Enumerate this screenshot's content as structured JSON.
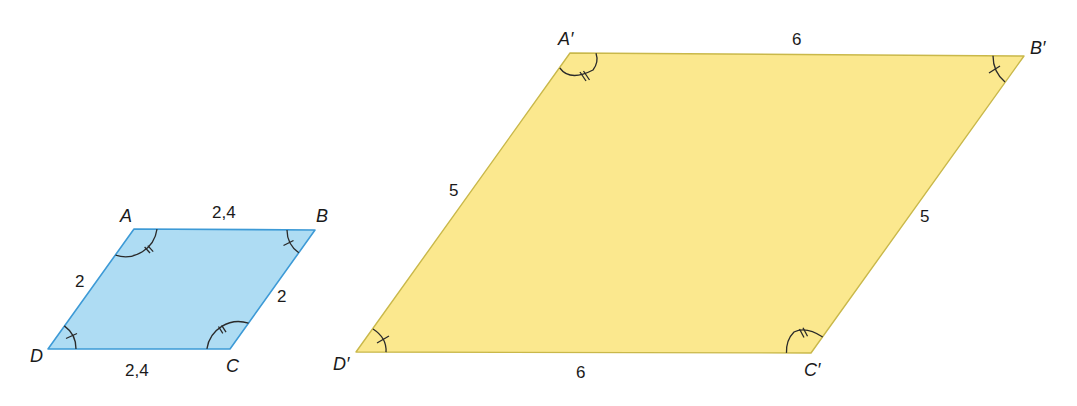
{
  "colors": {
    "small_fill": "#aedcf3",
    "small_stroke": "#3d9ad6",
    "large_fill": "#fbe88e",
    "large_stroke": "#c9b84a"
  },
  "small_parallelogram": {
    "name": "ABCD",
    "vertices": {
      "A": {
        "label": "A",
        "x": 134,
        "y": 229
      },
      "B": {
        "label": "B",
        "x": 315,
        "y": 230
      },
      "C": {
        "label": "C",
        "x": 230,
        "y": 349
      },
      "D": {
        "label": "D",
        "x": 48,
        "y": 349
      }
    },
    "sides": {
      "AB": "2,4",
      "BC": "2",
      "CD": "2,4",
      "DA": "2"
    },
    "angle_marks": {
      "A": "double-tick",
      "B": "single-tick",
      "C": "double-tick",
      "D": "single-tick"
    }
  },
  "large_parallelogram": {
    "name": "A'B'C'D'",
    "vertices": {
      "A": {
        "label": "A′",
        "x": 570,
        "y": 53
      },
      "B": {
        "label": "B′",
        "x": 1024,
        "y": 56
      },
      "C": {
        "label": "C′",
        "x": 811,
        "y": 353
      },
      "D": {
        "label": "D′",
        "x": 356,
        "y": 352
      }
    },
    "sides": {
      "AB": "6",
      "BC": "5",
      "CD": "6",
      "DA": "5"
    },
    "angle_marks": {
      "A": "double-tick",
      "B": "single-tick",
      "C": "double-tick",
      "D": "single-tick"
    }
  }
}
